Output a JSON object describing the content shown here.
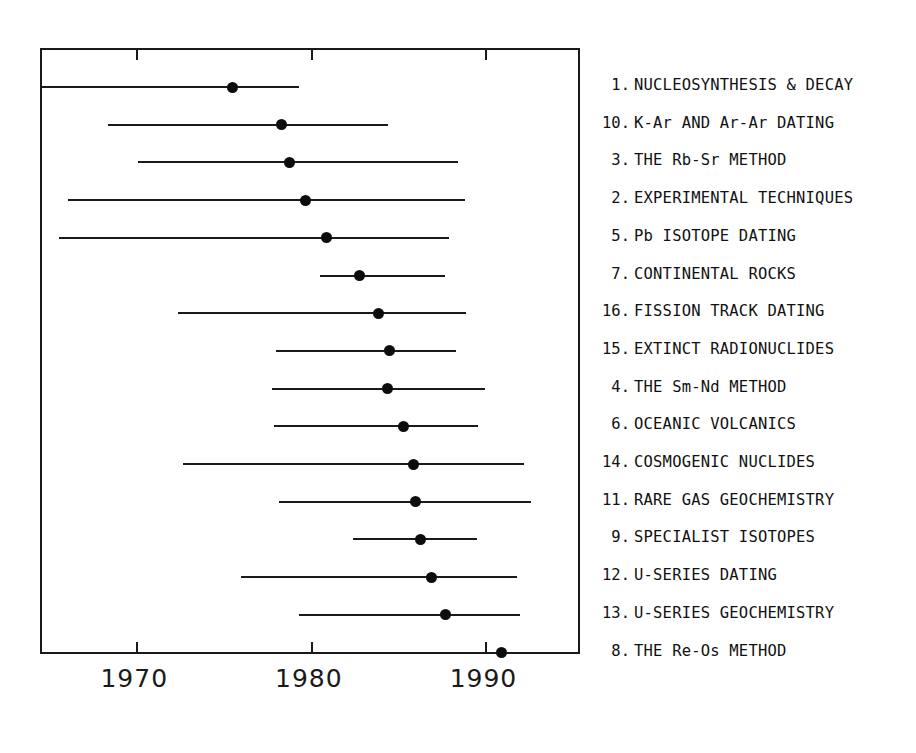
{
  "chart_data": {
    "type": "scatter",
    "title": "",
    "xlabel": "",
    "ylabel": "",
    "xlim": [
      1964.6,
      1995.3
    ],
    "grid": false,
    "legend": "right",
    "xticks": [
      1970,
      1980,
      1990
    ],
    "xtick_labels": [
      "1970",
      "1980",
      "1990"
    ],
    "note": "Horizontal range bars with a central dot marker; one row per chapter topic, ordered by increasing median year.",
    "series_name": "publication year range",
    "categories": [
      "1. NUCLEOSYNTHESIS & DECAY",
      "10. K-Ar AND Ar-Ar DATING",
      "3. THE Rb-Sr METHOD",
      "2. EXPERIMENTAL TECHNIQUES",
      "5. Pb ISOTOPE DATING",
      "7. CONTINENTAL ROCKS",
      "16. FISSION TRACK DATING",
      "15. EXTINCT RADIONUCLIDES",
      "4. THE Sm-Nd METHOD",
      "6. OCEANIC VOLCANICS",
      "14. COSMOGENIC NUCLIDES",
      "11. RARE GAS GEOCHEMISTRY",
      "9. SPECIALIST ISOTOPES",
      "12. U-SERIES DATING",
      "13. U-SERIES GEOCHEMISTRY",
      "8. THE Re-Os METHOD"
    ],
    "rows": [
      {
        "num": "1.",
        "label": "NUCLEOSYNTHESIS & DECAY",
        "low": 1964.6,
        "center": 1975.5,
        "high": 1979.3
      },
      {
        "num": "10.",
        "label": "K-Ar AND Ar-Ar DATING",
        "low": 1968.4,
        "center": 1978.3,
        "high": 1984.4
      },
      {
        "num": "3.",
        "label": "THE Rb-Sr METHOD",
        "low": 1970.1,
        "center": 1978.8,
        "high": 1988.4
      },
      {
        "num": "2.",
        "label": "EXPERIMENTAL TECHNIQUES",
        "low": 1966.1,
        "center": 1979.7,
        "high": 1988.8
      },
      {
        "num": "5.",
        "label": "Pb ISOTOPE DATING",
        "low": 1965.6,
        "center": 1980.9,
        "high": 1987.9
      },
      {
        "num": "7.",
        "label": "CONTINENTAL ROCKS",
        "low": 1980.5,
        "center": 1982.8,
        "high": 1987.7
      },
      {
        "num": "16.",
        "label": "FISSION TRACK DATING",
        "low": 1972.4,
        "center": 1983.9,
        "high": 1988.9
      },
      {
        "num": "15.",
        "label": "EXTINCT RADIONUCLIDES",
        "low": 1978.0,
        "center": 1984.5,
        "high": 1988.3
      },
      {
        "num": "4.",
        "label": "THE Sm-Nd METHOD",
        "low": 1977.8,
        "center": 1984.4,
        "high": 1990.0
      },
      {
        "num": "6.",
        "label": "OCEANIC VOLCANICS",
        "low": 1977.9,
        "center": 1985.3,
        "high": 1989.6
      },
      {
        "num": "14.",
        "label": "COSMOGENIC NUCLIDES",
        "low": 1972.7,
        "center": 1985.9,
        "high": 1992.2
      },
      {
        "num": "11.",
        "label": "RARE GAS GEOCHEMISTRY",
        "low": 1978.2,
        "center": 1986.0,
        "high": 1992.6
      },
      {
        "num": "9.",
        "label": "SPECIALIST ISOTOPES",
        "low": 1982.4,
        "center": 1986.3,
        "high": 1989.5
      },
      {
        "num": "12.",
        "label": "U-SERIES DATING",
        "low": 1976.0,
        "center": 1986.9,
        "high": 1991.8
      },
      {
        "num": "13.",
        "label": "U-SERIES GEOCHEMISTRY",
        "low": 1979.3,
        "center": 1987.7,
        "high": 1992.0
      },
      {
        "num": "8.",
        "label": "THE Re-Os METHOD",
        "low": 1986.0,
        "center": 1990.9,
        "high": 1993.3
      }
    ]
  },
  "colors": {
    "line": "#1a1a1a",
    "marker": "#0d0d0d",
    "background": "#ffffff"
  }
}
